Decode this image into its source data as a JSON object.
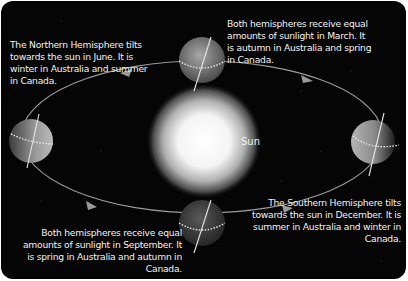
{
  "diagram": {
    "sun_label": "Sun",
    "colors": {
      "background": "#050505",
      "text": "#f2f2f2",
      "orbit": "#9a9a9a",
      "planet": "#6e6e6e",
      "sun_core": "#ffffff"
    },
    "positions": [
      {
        "id": "june",
        "month": "June",
        "caption": "The Northern Hemisphere tilts towards the sun in June. It is winter in Australia and summer in Canada."
      },
      {
        "id": "march",
        "month": "March",
        "caption": "Both hemispheres receive equal amounts of sunlight in March. It is autumn in Australia and spring in Canada."
      },
      {
        "id": "september",
        "month": "September",
        "caption": "Both hemispheres receive equal amounts of sunlight in September. It is spring in Australia and autumn in Canada."
      },
      {
        "id": "december",
        "month": "December",
        "caption": "The Southern Hemisphere tilts towards the sun in December. It is summer in Australia and winter in Canada."
      }
    ],
    "orbit_direction": "anticlockwise"
  }
}
